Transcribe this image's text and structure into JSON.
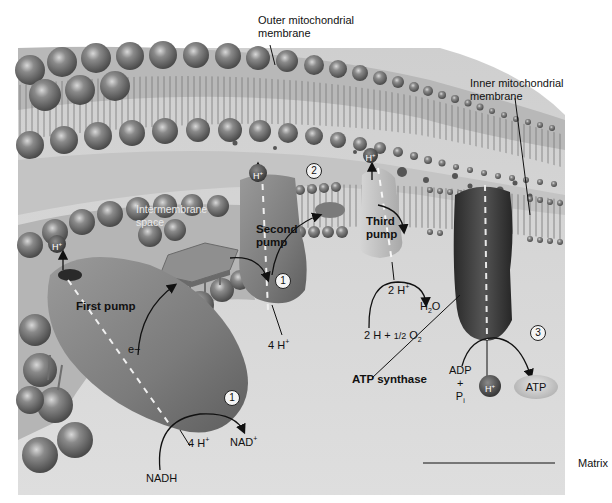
{
  "figure": {
    "type": "biology-illustration",
    "colors": {
      "background": "#ffffff",
      "matrix": "#d9d9d9",
      "intermembrane": "#c9c9c9",
      "lipid_head": "#7a7a7a",
      "pump": "#8c8c8c",
      "atp_synthase": "#3a3a3a",
      "h_ion": "#444444",
      "arrow": "#111111"
    }
  },
  "labels": {
    "outer_membrane": [
      "Outer mitochondrial",
      "membrane"
    ],
    "inner_membrane": [
      "Inner mitochondrial",
      "membrane"
    ],
    "intermembrane_space": [
      "Intermembrane",
      "space"
    ],
    "matrix": "Matrix",
    "first_pump": "First pump",
    "second_pump": [
      "Second",
      "pump"
    ],
    "third_pump": [
      "Third",
      "pump"
    ],
    "atp_synthase": "ATP synthase",
    "electron": "e−",
    "nadh": "NADH",
    "nad_plus": "NAD",
    "nad_plus_sup": "+",
    "four_h_first": "4 H",
    "four_h_second": "4 H",
    "two_h": "2 H",
    "h_sup": "+",
    "water": "H",
    "water_sub": "2",
    "water_o": "O",
    "oxygen_eq_pre": "2 H + ",
    "oxygen_half": "1/2",
    "oxygen_o": "O",
    "oxygen_sub": "2",
    "adp": "ADP",
    "plus": "+",
    "pi": "P",
    "pi_sub": "i",
    "atp": "ATP",
    "h_ion": "H",
    "step_1a": "1",
    "step_1b": "1",
    "step_2": "2",
    "step_3": "3"
  }
}
